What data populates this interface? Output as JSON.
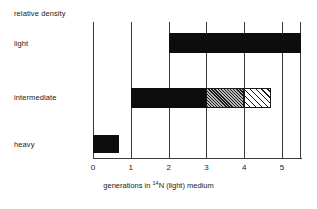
{
  "chart_data": {
    "type": "bar",
    "title": "",
    "subtitle": "",
    "xlabel_prefix": "generations in ",
    "xlabel_isotope_sup": "14",
    "xlabel_isotope": "N (light) medium",
    "xlabel_full": "generations in 14N (light) medium",
    "ylabel": "relative density",
    "xlim": [
      0,
      5.5
    ],
    "ylim": [
      0,
      3
    ],
    "grid": true,
    "legend": "none",
    "x_ticks": [
      "0",
      "1",
      "2",
      "3",
      "4",
      "5"
    ],
    "x_tick_values": [
      0,
      1,
      2,
      3,
      4,
      5
    ],
    "y_categories": [
      "light",
      "intermediate",
      "heavy"
    ],
    "bands": [
      {
        "name": "light",
        "label": "light",
        "row": 0,
        "segments": [
          {
            "start": 2.0,
            "end": 5.5,
            "fill": "solid",
            "color": "#0d0d0d"
          }
        ]
      },
      {
        "name": "intermediate",
        "label": "intermediate",
        "row": 1,
        "segments": [
          {
            "start": 1.0,
            "end": 3.0,
            "fill": "solid",
            "color": "#0d0d0d"
          },
          {
            "start": 3.0,
            "end": 4.0,
            "fill": "dense-hatch",
            "color": "#6e6e6e"
          },
          {
            "start": 4.0,
            "end": 4.7,
            "fill": "sparse-hatch",
            "color": "#ffffff"
          }
        ]
      },
      {
        "name": "heavy",
        "label": "heavy",
        "row": 2,
        "segments": [
          {
            "start": 0.0,
            "end": 0.7,
            "fill": "solid",
            "color": "#0d0d0d"
          }
        ]
      }
    ],
    "axis_color": "#3a3a3a",
    "background": "#ffffff"
  },
  "labels": {
    "relative_density": "relative density",
    "light": "light",
    "intermediate": "intermediate",
    "heavy": "heavy"
  },
  "xaxis": {
    "ticks": [
      "0",
      "1",
      "2",
      "3",
      "4",
      "5"
    ],
    "title_prefix": "generations in ",
    "title_sup": "14",
    "title_suffix": "N (light) medium"
  }
}
